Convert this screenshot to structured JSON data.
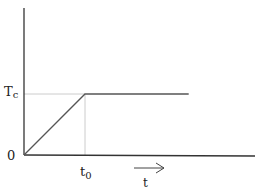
{
  "chart_data": {
    "type": "line",
    "title": "",
    "xlabel": "t",
    "ylabel": "",
    "origin_label": "0",
    "x_tick_labels": [
      {
        "base": "t",
        "sub": "0",
        "value": 1
      }
    ],
    "y_tick_labels": [
      {
        "base": "T",
        "sub": "c",
        "value": 1
      }
    ],
    "xlim": [
      0,
      4
    ],
    "ylim": [
      0,
      1.7
    ],
    "series": [
      {
        "name": "temperature",
        "points": [
          [
            0,
            0
          ],
          [
            1,
            1
          ],
          [
            2.7,
            1
          ]
        ]
      }
    ],
    "guides": [
      {
        "type": "horizontal",
        "y": 1,
        "x_from": 0,
        "x_to": 1
      },
      {
        "type": "vertical",
        "x": 1,
        "y_from": 0,
        "y_to": 1
      }
    ],
    "xlabel_arrow": true,
    "grid": false,
    "colors": {
      "axis": "#333333",
      "line": "#555555",
      "guide": "#cccccc"
    }
  }
}
